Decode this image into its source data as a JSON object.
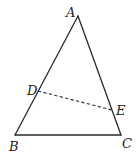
{
  "diagram": {
    "type": "geometry-triangle",
    "colors": {
      "stroke": "#2a2a2a",
      "label": "#222222",
      "background": "#ffffff"
    },
    "points": {
      "A": {
        "label": "A",
        "x": 78,
        "y": 16,
        "label_x": 66,
        "label_y": 17
      },
      "B": {
        "label": "B",
        "x": 15,
        "y": 135,
        "label_x": 9,
        "label_y": 151
      },
      "C": {
        "label": "C",
        "x": 121,
        "y": 135,
        "label_x": 122,
        "label_y": 148
      },
      "D": {
        "label": "D",
        "x": 38,
        "y": 91,
        "label_x": 27,
        "label_y": 95
      },
      "E": {
        "label": "E",
        "x": 112,
        "y": 110,
        "label_x": 116,
        "label_y": 115
      }
    },
    "segments": [
      {
        "from": "A",
        "to": "B",
        "style": "solid"
      },
      {
        "from": "A",
        "to": "C",
        "style": "solid"
      },
      {
        "from": "B",
        "to": "C",
        "style": "solid"
      },
      {
        "from": "D",
        "to": "E",
        "style": "dashed"
      }
    ]
  }
}
